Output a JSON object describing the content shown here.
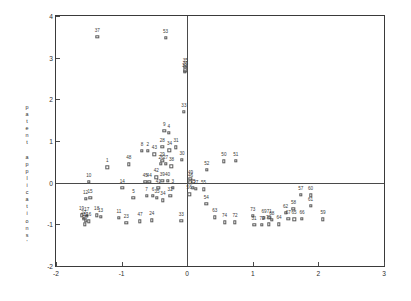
{
  "chart_data": {
    "type": "scatter",
    "title": "",
    "subtitle": "",
    "xlabel": "",
    "ylabel": "patent applications'",
    "ylabel_chars": [
      "p",
      "a",
      "t",
      "e",
      "n",
      "t",
      " ",
      "a",
      "p",
      "p",
      "l",
      "i",
      "c",
      "a",
      "t",
      "i",
      "o",
      "n",
      "s",
      "'"
    ],
    "xlim": [
      -2,
      3
    ],
    "ylim": [
      -2,
      4
    ],
    "xticks": [
      -2,
      -1,
      0,
      1,
      2,
      3
    ],
    "xticklabels": [
      "-2",
      "-1",
      "0",
      "1",
      "2",
      "3"
    ],
    "yticks": [
      -2,
      -1,
      0,
      1,
      2,
      3,
      4
    ],
    "yticklabels": [
      "-2",
      "-1",
      "0",
      "1",
      "2",
      "3",
      "4"
    ],
    "grid": false,
    "legend": "none",
    "marker": "open-square",
    "axis_cross_x": 0,
    "axis_cross_y": 0,
    "points": [
      {
        "label": "37",
        "x": -1.37,
        "y": 3.5
      },
      {
        "label": "53",
        "x": -0.33,
        "y": 3.47
      },
      {
        "label": "35",
        "x": -0.03,
        "y": 2.78
      },
      {
        "label": "36",
        "x": -0.03,
        "y": 2.7
      },
      {
        "label": "32",
        "x": -0.04,
        "y": 2.66
      },
      {
        "label": "33",
        "x": -0.05,
        "y": 1.7
      },
      {
        "label": "9",
        "x": -0.35,
        "y": 1.25
      },
      {
        "label": "4",
        "x": -0.28,
        "y": 1.19
      },
      {
        "label": "8",
        "x": -0.69,
        "y": 0.77
      },
      {
        "label": "2",
        "x": -0.6,
        "y": 0.76
      },
      {
        "label": "28",
        "x": -0.38,
        "y": 0.86
      },
      {
        "label": "34",
        "x": -0.27,
        "y": 0.78
      },
      {
        "label": "31",
        "x": -0.17,
        "y": 0.85
      },
      {
        "label": "43",
        "x": -0.5,
        "y": 0.68
      },
      {
        "label": "1",
        "x": -1.22,
        "y": 0.37
      },
      {
        "label": "48",
        "x": -0.89,
        "y": 0.44
      },
      {
        "label": "29",
        "x": -0.38,
        "y": 0.52
      },
      {
        "label": "26",
        "x": -0.4,
        "y": 0.46
      },
      {
        "label": "27",
        "x": -0.33,
        "y": 0.45
      },
      {
        "label": "30",
        "x": -0.08,
        "y": 0.55
      },
      {
        "label": "38",
        "x": -0.24,
        "y": 0.39
      },
      {
        "label": "52",
        "x": 0.3,
        "y": 0.31
      },
      {
        "label": "50",
        "x": 0.56,
        "y": 0.51
      },
      {
        "label": "51",
        "x": 0.74,
        "y": 0.52
      },
      {
        "label": "10",
        "x": -1.5,
        "y": 0.02
      },
      {
        "label": "42",
        "x": -0.47,
        "y": 0.13
      },
      {
        "label": "45",
        "x": -0.64,
        "y": 0.02
      },
      {
        "label": "44",
        "x": -0.58,
        "y": 0.02
      },
      {
        "label": "40",
        "x": -0.3,
        "y": 0.04
      },
      {
        "label": "39",
        "x": -0.38,
        "y": 0.05
      },
      {
        "label": "49",
        "x": 0.05,
        "y": 0.09
      },
      {
        "label": "46",
        "x": 0.05,
        "y": 0.01
      },
      {
        "label": "14",
        "x": -0.99,
        "y": -0.13
      },
      {
        "label": "41",
        "x": -0.44,
        "y": -0.12
      },
      {
        "label": "3",
        "x": -0.22,
        "y": -0.13
      },
      {
        "label": "25",
        "x": 0.09,
        "y": -0.13
      },
      {
        "label": "27b",
        "x": 0.13,
        "y": -0.14
      },
      {
        "label": "55",
        "x": 0.25,
        "y": -0.16
      },
      {
        "label": "5",
        "x": -0.82,
        "y": -0.37
      },
      {
        "label": "7",
        "x": -0.62,
        "y": -0.31
      },
      {
        "label": "6",
        "x": -0.52,
        "y": -0.32
      },
      {
        "label": "35b",
        "x": -0.46,
        "y": -0.37
      },
      {
        "label": "32b",
        "x": -0.26,
        "y": -0.31
      },
      {
        "label": "34b",
        "x": -0.37,
        "y": -0.42
      },
      {
        "label": "56",
        "x": 0.03,
        "y": -0.28
      },
      {
        "label": "54",
        "x": 0.29,
        "y": -0.5
      },
      {
        "label": "19",
        "x": -1.61,
        "y": -0.78
      },
      {
        "label": "17",
        "x": -1.53,
        "y": -0.8
      },
      {
        "label": "12",
        "x": -1.55,
        "y": -0.38
      },
      {
        "label": "15",
        "x": -1.48,
        "y": -0.36
      },
      {
        "label": "18",
        "x": -1.38,
        "y": -0.78
      },
      {
        "label": "13",
        "x": -1.32,
        "y": -0.82
      },
      {
        "label": "22",
        "x": -1.58,
        "y": -0.87
      },
      {
        "label": "21",
        "x": -1.55,
        "y": -0.91
      },
      {
        "label": "16",
        "x": -1.5,
        "y": -0.93
      },
      {
        "label": "20",
        "x": -1.56,
        "y": -1.0
      },
      {
        "label": "11",
        "x": -1.04,
        "y": -0.84
      },
      {
        "label": "23",
        "x": -0.93,
        "y": -0.97
      },
      {
        "label": "47",
        "x": -0.72,
        "y": -0.93
      },
      {
        "label": "24",
        "x": -0.54,
        "y": -0.9
      },
      {
        "label": "33b",
        "x": -0.09,
        "y": -0.92
      },
      {
        "label": "63",
        "x": 0.42,
        "y": -0.83
      },
      {
        "label": "74",
        "x": 0.57,
        "y": -0.95
      },
      {
        "label": "72",
        "x": 0.73,
        "y": -0.95
      },
      {
        "label": "73",
        "x": 1.0,
        "y": -0.8
      },
      {
        "label": "69",
        "x": 1.17,
        "y": -0.84
      },
      {
        "label": "71",
        "x": 1.25,
        "y": -0.84
      },
      {
        "label": "68",
        "x": 1.29,
        "y": -0.89
      },
      {
        "label": "31b",
        "x": 1.02,
        "y": -1.01
      },
      {
        "label": "72b",
        "x": 1.14,
        "y": -1.01
      },
      {
        "label": "70",
        "x": 1.24,
        "y": -1.0
      },
      {
        "label": "64",
        "x": 1.4,
        "y": -1.0
      },
      {
        "label": "62",
        "x": 1.5,
        "y": -0.72
      },
      {
        "label": "58",
        "x": 1.62,
        "y": -0.63
      },
      {
        "label": "67",
        "x": 1.54,
        "y": -0.86
      },
      {
        "label": "65",
        "x": 1.63,
        "y": -0.88
      },
      {
        "label": "66",
        "x": 1.75,
        "y": -0.86
      },
      {
        "label": "57",
        "x": 1.73,
        "y": -0.29
      },
      {
        "label": "60",
        "x": 1.88,
        "y": -0.3
      },
      {
        "label": "61",
        "x": 1.88,
        "y": -0.55
      },
      {
        "label": "59",
        "x": 2.07,
        "y": -0.88
      }
    ]
  }
}
